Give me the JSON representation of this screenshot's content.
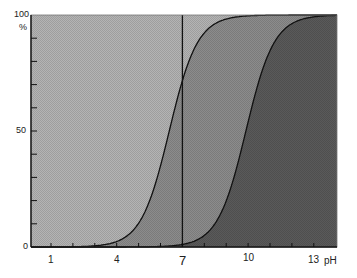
{
  "chart_data": {
    "type": "area",
    "title": "",
    "xlabel": "pH",
    "ylabel": "%",
    "xlim": [
      0.1,
      14.1
    ],
    "ylim": [
      0,
      100
    ],
    "x_tick_labels": [
      "1",
      "4",
      "7",
      "10",
      "13"
    ],
    "x_minor_ticks": [
      1,
      2,
      3,
      4,
      5,
      6,
      7,
      8,
      9,
      10,
      11,
      12,
      13
    ],
    "y_tick_labels": [
      "0",
      "50",
      "100"
    ],
    "y_minor_ticks": [
      10,
      20,
      30,
      40,
      50,
      60,
      70,
      80,
      90
    ],
    "grid": false,
    "legend": null,
    "reference_line": {
      "x": 7,
      "orientation": "vertical"
    },
    "series": [
      {
        "name": "curve-1",
        "shape": "sigmoid",
        "midpoint_pH": 6.4,
        "slope": 1.55,
        "x": [
          3,
          4,
          5,
          5.5,
          6,
          6.4,
          7,
          7.5,
          8,
          9,
          10
        ],
        "values": [
          0.5,
          2,
          10,
          20,
          36,
          50,
          72,
          84,
          92,
          98,
          100
        ]
      },
      {
        "name": "curve-2",
        "shape": "sigmoid",
        "midpoint_pH": 9.9,
        "slope": 1.55,
        "x": [
          6.5,
          7.5,
          8.5,
          9,
          9.5,
          9.9,
          10.5,
          11,
          11.5,
          12.5,
          13.5
        ],
        "values": [
          0.5,
          2,
          10,
          20,
          36,
          50,
          72,
          84,
          92,
          98,
          100
        ]
      }
    ],
    "region_fills": [
      "#b4b4b4",
      "#8c8c8c",
      "#5a5a5a"
    ]
  },
  "labels": {
    "y_unit": "%",
    "y_0": "0",
    "y_50": "50",
    "y_100": "100",
    "x_1": "1",
    "x_4": "4",
    "x_7": "7",
    "x_10": "10",
    "x_13": "13",
    "x_unit": "pH"
  }
}
